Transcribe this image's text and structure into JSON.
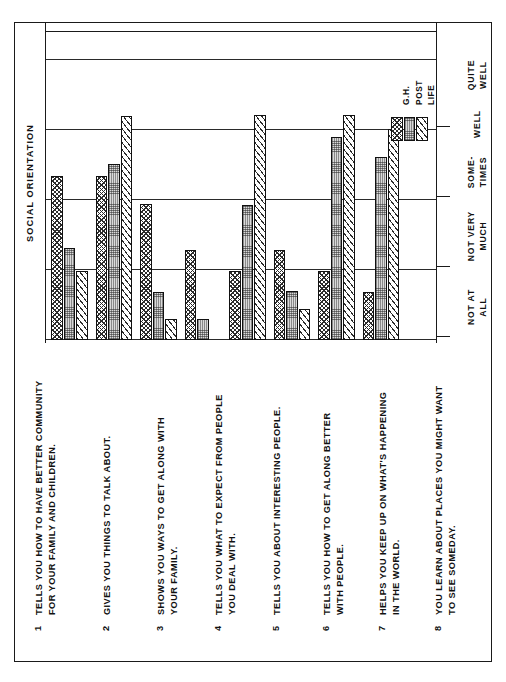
{
  "chart_data": {
    "type": "bar",
    "title": "SOCIAL ORIENTATION",
    "xlabel": "",
    "ylabel": "",
    "orientation": "rotated-90",
    "grid": true,
    "legend_position": "inside-top-right",
    "scale_labels": [
      "NOT AT ALL",
      "NOT VERY MUCH",
      "SOME-TIMES",
      "WELL",
      "QUITE WELL"
    ],
    "scale_values": [
      0,
      1,
      2,
      3,
      4
    ],
    "categories": [
      "1",
      "2",
      "3",
      "4",
      "5",
      "6",
      "7",
      "8"
    ],
    "category_labels": [
      "TELLS YOU HOW TO HAVE BETTER COMMUNITY FOR YOUR FAMILY AND CHILDREN.",
      "GIVES YOU THINGS TO TALK ABOUT.",
      "SHOWS YOU WAYS TO GET ALONG WITH YOUR FAMILY.",
      "TELLS YOU WHAT TO EXPECT FROM PEOPLE YOU DEAL WITH.",
      "TELLS YOU ABOUT INTERESTING PEOPLE.",
      "TELLS YOU HOW TO GET ALONG BETTER WITH PEOPLE.",
      "HELPS YOU KEEP UP ON WHAT'S HAPPENING IN THE WORLD.",
      "YOU LEARN ABOUT PLACES YOU MIGHT WANT TO SEE SOMEDAY."
    ],
    "series": [
      {
        "name": "G.H.",
        "pattern": "checkered",
        "values": [
          2.35,
          2.35,
          1.95,
          1.28,
          0.99,
          1.28,
          0.99,
          0.68
        ]
      },
      {
        "name": "POST",
        "pattern": "stipple-gray",
        "values": [
          1.32,
          2.52,
          0.68,
          0.3,
          1.93,
          0.7,
          2.9,
          2.62
        ]
      },
      {
        "name": "LIFE",
        "pattern": "diagonal-hatch",
        "values": [
          0.99,
          3.2,
          0.3,
          0.0,
          3.22,
          0.44,
          3.22,
          3.02
        ]
      }
    ]
  },
  "chart": {
    "title": "SOCIAL ORIENTATION",
    "legend": [
      {
        "label": "G.H."
      },
      {
        "label": "POST"
      },
      {
        "label": "LIFE"
      }
    ],
    "scale": [
      {
        "label": "NOT AT ALL"
      },
      {
        "label": "NOT VERY MUCH"
      },
      {
        "label": "SOME-TIMES"
      },
      {
        "label": "WELL"
      },
      {
        "label": "QUITE WELL"
      }
    ]
  },
  "items": [
    {
      "num": "1",
      "text": "TELLS YOU HOW TO HAVE BETTER COMMUNITY\nFOR YOUR FAMILY AND CHILDREN."
    },
    {
      "num": "2",
      "text": "GIVES YOU THINGS TO TALK ABOUT."
    },
    {
      "num": "3",
      "text": "SHOWS YOU WAYS TO GET ALONG WITH\nYOUR FAMILY."
    },
    {
      "num": "4",
      "text": "TELLS YOU WHAT TO EXPECT FROM PEOPLE\nYOU DEAL WITH."
    },
    {
      "num": "5",
      "text": "TELLS YOU ABOUT INTERESTING PEOPLE."
    },
    {
      "num": "6",
      "text": "TELLS YOU HOW TO GET ALONG BETTER\nWITH PEOPLE."
    },
    {
      "num": "7",
      "text": "HELPS YOU KEEP UP ON WHAT'S HAPPENING\nIN THE WORLD."
    },
    {
      "num": "8",
      "text": "YOU LEARN ABOUT PLACES YOU MIGHT WANT\nTO SEE SOMEDAY."
    }
  ],
  "colors": {
    "ink": "#1a1a1a",
    "paper": "#ffffff",
    "post_fill": "#d9d9d9"
  }
}
